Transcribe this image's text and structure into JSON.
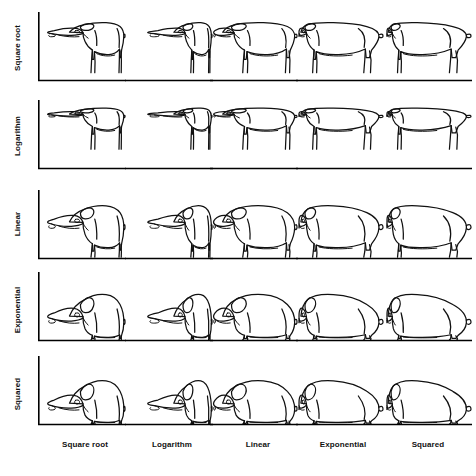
{
  "figure": {
    "background_color": "#ffffff",
    "ink_color": "#111111",
    "grid_rows": 5,
    "grid_cols": 5
  },
  "axes": {
    "y_axis_label_orientation": "vertical",
    "x_axis_label_orientation": "horizontal",
    "row_axis": "y-axis transformation",
    "col_axis": "x-axis transformation"
  },
  "rows": [
    {
      "id": "row-square-root",
      "label": "Square root",
      "scale": "sqrt",
      "exponent": 0.5
    },
    {
      "id": "row-logarithm",
      "label": "Logarithm",
      "scale": "log",
      "exponent": 0.28
    },
    {
      "id": "row-linear",
      "label": "Linear",
      "scale": "linear",
      "exponent": 1.0
    },
    {
      "id": "row-exponential",
      "label": "Exponential",
      "scale": "exp",
      "exponent": 1.75
    },
    {
      "id": "row-squared",
      "label": "Squared",
      "scale": "square",
      "exponent": 2.0
    }
  ],
  "cols": [
    {
      "id": "col-square-root",
      "label": "Square root",
      "scale": "sqrt",
      "exponent": 0.5
    },
    {
      "id": "col-logarithm",
      "label": "Logarithm",
      "scale": "log",
      "exponent": 0.28
    },
    {
      "id": "col-linear",
      "label": "Linear",
      "scale": "linear",
      "exponent": 1.0
    },
    {
      "id": "col-exponential",
      "label": "Exponential",
      "scale": "exp",
      "exponent": 1.75
    },
    {
      "id": "col-squared",
      "label": "Squared",
      "scale": "square",
      "exponent": 2.0
    }
  ],
  "cells": [
    {
      "row": "Square root",
      "col": "Square root",
      "subject": "pig"
    },
    {
      "row": "Square root",
      "col": "Logarithm",
      "subject": "pig"
    },
    {
      "row": "Square root",
      "col": "Linear",
      "subject": "pig"
    },
    {
      "row": "Square root",
      "col": "Exponential",
      "subject": "pig"
    },
    {
      "row": "Square root",
      "col": "Squared",
      "subject": "pig"
    },
    {
      "row": "Logarithm",
      "col": "Square root",
      "subject": "pig"
    },
    {
      "row": "Logarithm",
      "col": "Logarithm",
      "subject": "pig"
    },
    {
      "row": "Logarithm",
      "col": "Linear",
      "subject": "pig"
    },
    {
      "row": "Logarithm",
      "col": "Exponential",
      "subject": "pig"
    },
    {
      "row": "Logarithm",
      "col": "Squared",
      "subject": "pig"
    },
    {
      "row": "Linear",
      "col": "Square root",
      "subject": "pig"
    },
    {
      "row": "Linear",
      "col": "Logarithm",
      "subject": "pig"
    },
    {
      "row": "Linear",
      "col": "Linear",
      "subject": "pig"
    },
    {
      "row": "Linear",
      "col": "Exponential",
      "subject": "pig"
    },
    {
      "row": "Linear",
      "col": "Squared",
      "subject": "pig"
    },
    {
      "row": "Exponential",
      "col": "Square root",
      "subject": "pig"
    },
    {
      "row": "Exponential",
      "col": "Logarithm",
      "subject": "pig"
    },
    {
      "row": "Exponential",
      "col": "Linear",
      "subject": "pig"
    },
    {
      "row": "Exponential",
      "col": "Exponential",
      "subject": "pig"
    },
    {
      "row": "Exponential",
      "col": "Squared",
      "subject": "pig"
    },
    {
      "row": "Squared",
      "col": "Square root",
      "subject": "pig"
    },
    {
      "row": "Squared",
      "col": "Logarithm",
      "subject": "pig"
    },
    {
      "row": "Squared",
      "col": "Linear",
      "subject": "pig"
    },
    {
      "row": "Squared",
      "col": "Exponential",
      "subject": "pig"
    },
    {
      "row": "Squared",
      "col": "Squared",
      "subject": "pig"
    }
  ],
  "layout": {
    "cell_width": 90,
    "cell_height": 88,
    "row_tops": [
      12,
      100,
      190,
      272,
      356
    ],
    "col_lefts": [
      38,
      125,
      210,
      296,
      384
    ],
    "baseline_y": [
      80,
      168,
      256,
      344,
      428
    ],
    "col_label_centers": [
      85,
      172,
      258,
      343,
      428
    ],
    "col_label_y": 440,
    "row_label_centers": [
      48,
      136,
      224,
      310,
      394
    ],
    "row_label_x": 18
  }
}
